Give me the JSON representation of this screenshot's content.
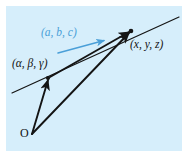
{
  "figure": {
    "type": "vector-diagram",
    "background_color": "#ffffff",
    "panel_color": "#d6eefb",
    "panel_rect": {
      "x": 6,
      "y": 6,
      "width": 176,
      "height": 145
    },
    "line_color": "#141414",
    "accent_color": "#4a9fd8",
    "labels": {
      "direction_vector": "(a, b, c)",
      "point_on_line": "(α, β, γ)",
      "point_general": "(x, y, z)",
      "origin": "O"
    },
    "points": {
      "origin": {
        "x": 32,
        "y": 134
      },
      "point_alpha": {
        "x": 48,
        "y": 78
      },
      "point_xyz": {
        "x": 131,
        "y": 31
      }
    },
    "line_through_points": {
      "x1": 12,
      "y1": 93,
      "x2": 179,
      "y2": 17
    },
    "arrows": [
      {
        "name": "origin-to-alpha",
        "x1": 32,
        "y1": 134,
        "x2": 48,
        "y2": 79,
        "color": "#141414"
      },
      {
        "name": "origin-to-xyz",
        "x1": 32,
        "y1": 134,
        "x2": 130,
        "y2": 32,
        "color": "#141414"
      },
      {
        "name": "alpha-to-xyz",
        "x1": 49,
        "y1": 77,
        "x2": 130,
        "y2": 31,
        "color": "#141414"
      },
      {
        "name": "direction-vector",
        "x1": 58,
        "y1": 53,
        "x2": 105,
        "y2": 40,
        "color": "#4a9fd8"
      }
    ]
  }
}
